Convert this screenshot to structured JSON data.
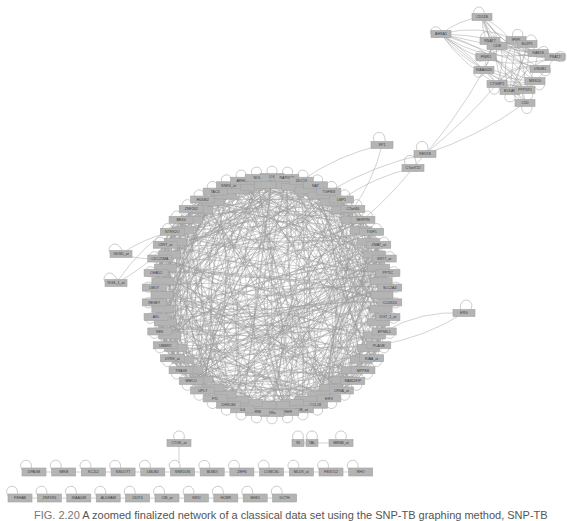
{
  "caption": {
    "figure_label": "FIG. 2.20",
    "text": "A zoomed finalized network of a classical data set using the SNP-TB graphing method, SNP-TB"
  },
  "colors": {
    "node_fill": "#b4b4b4",
    "edge": "#9a9a9a",
    "text": "#3a3a3a"
  },
  "main_cluster": {
    "cx": 272,
    "cy": 295,
    "r": 118,
    "nodes": [
      "SOX1",
      "RAPGEF",
      "ZDC18",
      "NAT",
      "TGFB3I",
      "LMP1",
      "C7orf40",
      "SERPIN",
      "TGIF1",
      "ZMAT_at",
      "KRT7_at",
      "PPTIC",
      "SLC2A4",
      "CLDN10",
      "DGT_1_at",
      "EPS8L1",
      "PLAUB",
      "KIAA_at",
      "MPPS8",
      "RAB11FIP",
      "CRNA_at",
      "EIF3",
      "CCL18",
      "NOB_at",
      "CRHR",
      "ERa",
      "HRB",
      "IL6",
      "DHXLB4",
      "FTL",
      "UPL7",
      "MMCO",
      "TRAX8",
      "DYRK_at",
      "UMBR2",
      "NEK",
      "AXL",
      "RESET",
      "LMO7",
      "CHAD2",
      "CDC25MA",
      "CR97_at",
      "NTRK2O",
      "BEX4",
      "ZNF262",
      "HDDB2",
      "TAC3",
      "SNRK_at",
      "ARHG2",
      "NOL"
    ]
  },
  "top_right_cluster": {
    "nodes": [
      {
        "label": "CD51B",
        "x": 482,
        "y": 17
      },
      {
        "label": "AHSA1",
        "x": 441,
        "y": 34
      },
      {
        "label": "RNAT7",
        "x": 490,
        "y": 41
      },
      {
        "label": "IFNN",
        "x": 516,
        "y": 40
      },
      {
        "label": "CDB",
        "x": 497,
        "y": 46
      },
      {
        "label": "SUZP1",
        "x": 527,
        "y": 44
      },
      {
        "label": "RAB18",
        "x": 538,
        "y": 53
      },
      {
        "label": "PSAT2",
        "x": 555,
        "y": 57
      },
      {
        "label": "FNIR1",
        "x": 486,
        "y": 57
      },
      {
        "label": "UNGB1",
        "x": 540,
        "y": 69
      },
      {
        "label": "KIAA0020",
        "x": 484,
        "y": 70
      },
      {
        "label": "MSS10",
        "x": 535,
        "y": 81
      },
      {
        "label": "CTGBP2",
        "x": 497,
        "y": 84
      },
      {
        "label": "ELKAN",
        "x": 510,
        "y": 91
      },
      {
        "label": "PPP1R1",
        "x": 525,
        "y": 90
      },
      {
        "label": "C1D",
        "x": 525,
        "y": 103
      }
    ]
  },
  "bridge_nodes": [
    {
      "label": "SP1",
      "x": 382,
      "y": 145
    },
    {
      "label": "REV18",
      "x": 425,
      "y": 154
    },
    {
      "label": "C7orf722",
      "x": 413,
      "y": 168
    }
  ],
  "left_nodes": [
    {
      "label": "GDSD_at",
      "x": 121,
      "y": 254
    },
    {
      "label": "RGS_1_at",
      "x": 116,
      "y": 283
    }
  ],
  "right_node": {
    "label": "ERG",
    "x": 464,
    "y": 313
  },
  "bottom_groups": {
    "mid_row": [
      {
        "label": "CTGK_at",
        "x": 179,
        "y": 443
      },
      {
        "label": "IN",
        "x": 298,
        "y": 443
      },
      {
        "label": "TAL",
        "x": 312,
        "y": 443
      },
      {
        "label": "MBNB_at",
        "x": 341,
        "y": 443
      }
    ],
    "row1": [
      "DPAGB",
      "IMKB",
      "KCJ12",
      "NSUO7T",
      "LMLBD",
      "SNRDUN",
      "BLMDI",
      "ZEFN",
      "COMCSL",
      "MLDK_at",
      "FBXO12",
      "RHO"
    ],
    "row2": [
      "FSHAB",
      "ZNF1R6",
      "KIAA038",
      "ALDHAM",
      "DDIT4",
      "CIB_at",
      "NR1I",
      "HCMR",
      "BHS1",
      "DCTH"
    ]
  }
}
